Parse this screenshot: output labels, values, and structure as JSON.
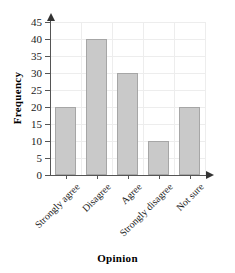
{
  "chart_data": {
    "type": "bar",
    "title": "",
    "xlabel": "Opinion",
    "ylabel": "Frequency",
    "categories": [
      "Strongly agree",
      "Disagree",
      "Agree",
      "Strongly disagree",
      "Not sure"
    ],
    "values": [
      20,
      40,
      30,
      10,
      20
    ],
    "ylim": [
      0,
      45
    ],
    "ytick_labels": [
      "45",
      "40",
      "35",
      "30",
      "25",
      "20",
      "15",
      "10",
      "5",
      "0"
    ],
    "ytick_values": [
      45,
      40,
      35,
      30,
      25,
      20,
      15,
      10,
      5,
      0
    ],
    "ytick_step": 5,
    "grid": true,
    "legend": false,
    "bar_fill_color": "#c9c9c9",
    "bar_border_color": "#a6a6a6",
    "gridline_color": "#ededed",
    "axis_color": "#555555",
    "xtick_label_rotation": -45
  },
  "clipped_title_remnant": "",
  "axis_titles": {
    "x": "Opinion",
    "y": "Frequency"
  }
}
